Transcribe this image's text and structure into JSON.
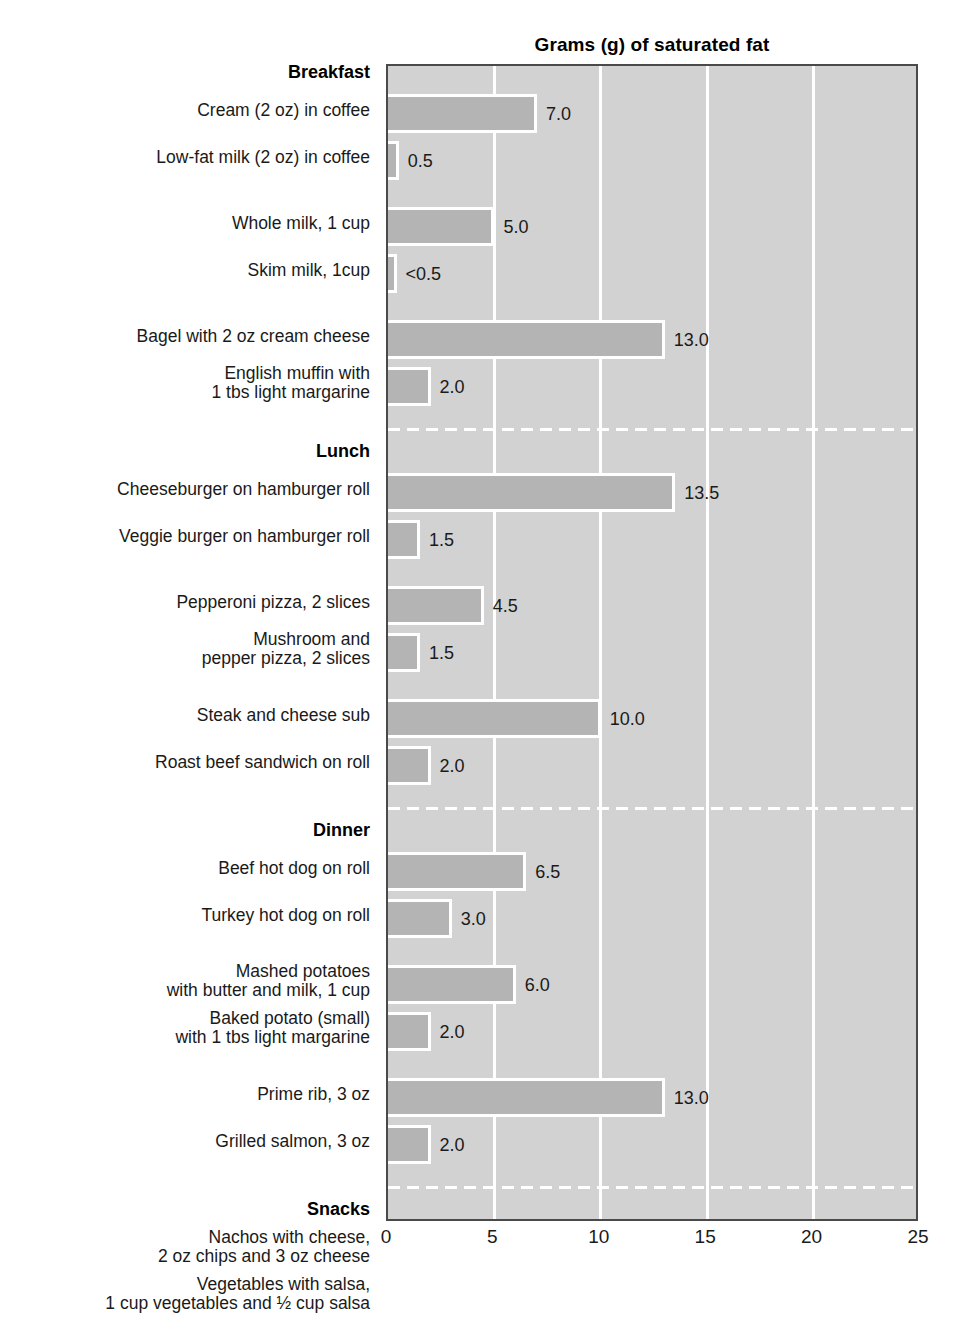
{
  "chart_data": {
    "type": "bar",
    "orientation": "horizontal",
    "title": "Grams (g) of saturated fat",
    "xlabel": "",
    "ylabel": "",
    "xlim": [
      0,
      25
    ],
    "xticks": [
      "0",
      "5",
      "10",
      "15",
      "20",
      "25"
    ],
    "xtick_values": [
      0,
      5,
      10,
      15,
      20,
      25
    ],
    "grid": "vertical gridlines at every 5 units, white on gray panel",
    "legend": "none",
    "bar_color": "#b4b4b4",
    "panel_color": "#d2d2d2",
    "groups": [
      {
        "name": "Breakfast",
        "items": [
          {
            "label": "Cream (2 oz) in coffee",
            "value": 7.0,
            "value_label": "7.0"
          },
          {
            "label": "Low-fat milk (2 oz) in coffee",
            "value": 0.5,
            "value_label": "0.5"
          },
          {
            "label": "Whole milk, 1 cup",
            "value": 5.0,
            "value_label": "5.0"
          },
          {
            "label": "Skim milk, 1cup",
            "value": 0.4,
            "value_label": "<0.5"
          },
          {
            "label": "Bagel with 2 oz cream cheese",
            "value": 13.0,
            "value_label": "13.0"
          },
          {
            "label": "English muffin with\n1 tbs light margarine",
            "value": 2.0,
            "value_label": "2.0"
          }
        ]
      },
      {
        "name": "Lunch",
        "items": [
          {
            "label": "Cheeseburger on hamburger roll",
            "value": 13.5,
            "value_label": "13.5"
          },
          {
            "label": "Veggie burger on hamburger roll",
            "value": 1.5,
            "value_label": "1.5"
          },
          {
            "label": "Pepperoni pizza, 2 slices",
            "value": 4.5,
            "value_label": "4.5"
          },
          {
            "label": "Mushroom and\npepper pizza, 2 slices",
            "value": 1.5,
            "value_label": "1.5"
          },
          {
            "label": "Steak and cheese sub",
            "value": 10.0,
            "value_label": "10.0"
          },
          {
            "label": "Roast beef sandwich on roll",
            "value": 2.0,
            "value_label": "2.0"
          }
        ]
      },
      {
        "name": "Dinner",
        "items": [
          {
            "label": "Beef hot dog on roll",
            "value": 6.5,
            "value_label": "6.5"
          },
          {
            "label": "Turkey hot dog on roll",
            "value": 3.0,
            "value_label": "3.0"
          },
          {
            "label": "Mashed potatoes\nwith butter and milk, 1 cup",
            "value": 6.0,
            "value_label": "6.0"
          },
          {
            "label": "Baked potato (small)\nwith 1 tbs light margarine",
            "value": 2.0,
            "value_label": "2.0"
          },
          {
            "label": "Prime rib, 3 oz",
            "value": 13.0,
            "value_label": "13.0"
          },
          {
            "label": "Grilled salmon, 3 oz",
            "value": 2.0,
            "value_label": "2.0"
          }
        ]
      },
      {
        "name": "Snacks",
        "items": [
          {
            "label": "Nachos with cheese,\n2 oz chips and 3 oz cheese",
            "value": 21.0,
            "value_label": "21.0"
          },
          {
            "label": "Vegetables with salsa,\n1 cup vegetables and ½ cup salsa",
            "value": 0,
            "value_label": "0"
          },
          {
            "label": "Gourmet vanilla ice cream, 1 cup",
            "value": 21.0,
            "value_label": "21.0"
          },
          {
            "label": "Gourmet lemon sorbet, 1 cup",
            "value": 0,
            "value_label": "0"
          }
        ]
      }
    ]
  }
}
